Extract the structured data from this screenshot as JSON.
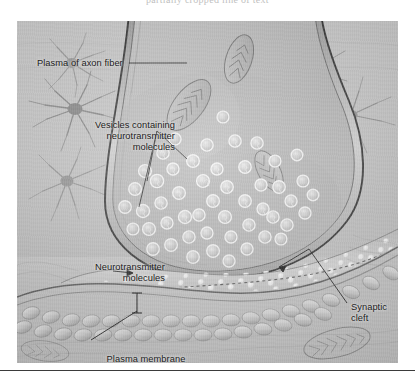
{
  "page": {
    "top_cut_text": "partially cropped line of text",
    "background_color": "#ffffff"
  },
  "figure": {
    "kind": "anatomical-diagram",
    "colors": {
      "frame_fill": "#c3c3c3",
      "terminal_fill": "#b8b8b8",
      "membrane_line": "#2a2a2a",
      "vesicle_outline": "#f2f2f2",
      "label_text": "#1b1b1b",
      "rule": "#3b3b3b"
    },
    "labels": {
      "plasma_axon": "Plasma of axon fiber",
      "vesicles": "Vesicles containing\nneurotransmitter\nmolecules",
      "neurotransmitter": "Neurotransmitter\nmolecules",
      "synaptic_cleft": "Synaptic cleft",
      "postsynaptic_membrane": "Plasma membrane\nof postsynaptic neuron"
    },
    "structures": [
      "presynaptic axon terminal",
      "mitochondria",
      "synaptic vesicles",
      "neurotransmitter molecules",
      "synaptic cleft",
      "postsynaptic membrane",
      "surrounding glial cells"
    ]
  }
}
